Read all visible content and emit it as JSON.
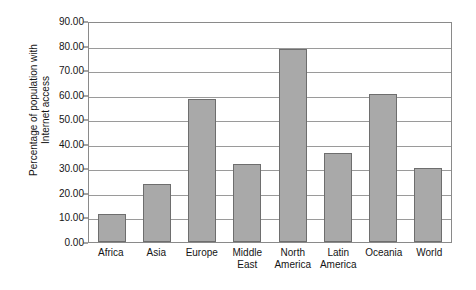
{
  "chart_data": {
    "type": "bar",
    "title": "",
    "subtitle": "",
    "xlabel": "",
    "ylabel": "Percentage of population with Internet access",
    "ylabel_lines": [
      "Percentage of population with",
      "Internet access"
    ],
    "categories": [
      "Africa",
      "Asia",
      "Europe",
      "Middle East",
      "North America",
      "Latin America",
      "Oceania",
      "World"
    ],
    "category_lines": [
      [
        "Africa"
      ],
      [
        "Asia"
      ],
      [
        "Europe"
      ],
      [
        "Middle",
        "East"
      ],
      [
        "North",
        "America"
      ],
      [
        "Latin",
        "America"
      ],
      [
        "Oceania"
      ],
      [
        "World"
      ]
    ],
    "values": [
      11.5,
      23.8,
      58.4,
      31.7,
      78.6,
      36.2,
      60.4,
      30.2
    ],
    "ylim": [
      0.0,
      90.0
    ],
    "ytick_values": [
      0.0,
      10.0,
      20.0,
      30.0,
      40.0,
      50.0,
      60.0,
      70.0,
      80.0,
      90.0
    ],
    "ytick_labels": [
      "0.00",
      "10.00",
      "20.00",
      "30.00",
      "40.00",
      "50.00",
      "60.00",
      "70.00",
      "80.00",
      "90.00"
    ],
    "grid": true,
    "grid_axis": "y",
    "legend": false,
    "legend_position": "none",
    "bar_color": "#a9a9a9",
    "bar_border_color": "#6e6e6e",
    "grid_color": "#9a9a9a",
    "axis_color": "#8a8a8a",
    "background_color": "#ffffff",
    "text_color": "#141414"
  }
}
